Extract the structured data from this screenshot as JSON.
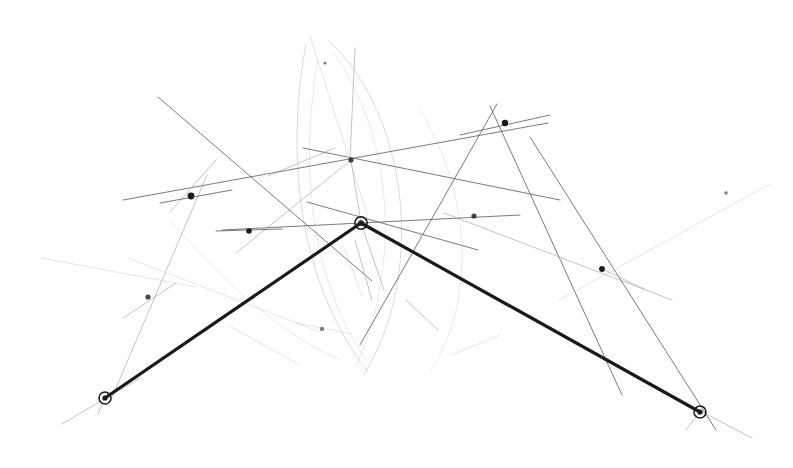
{
  "figure": {
    "medium": "pencil-on-paper scan",
    "canvas": {
      "width": 793,
      "height": 468,
      "background": "#ffffff"
    },
    "ink": {
      "primary_path": "#1a1a1a",
      "construction_line": "#5a5a62",
      "faint_line": "#9a9aa2",
      "very_faint_line": "#c2c2c8",
      "arc": "#b4b4bc",
      "node_fill": "#1a1a1a",
      "ring_stroke": "#1a1a1a"
    },
    "stroke_widths": {
      "primary_path": 3.2,
      "construction_line": 0.85,
      "faint_line": 0.7,
      "very_faint_line": 0.6,
      "arc": 0.7
    }
  },
  "chart_data": {
    "type": "scatter",
    "xlabel": "",
    "ylabel": "",
    "xlim": [
      0,
      793
    ],
    "ylim": [
      0,
      468
    ],
    "grid": false,
    "legend": null,
    "annotations": [],
    "ringed_vertices": [
      {
        "name": "left-vertex",
        "x": 105,
        "y": 398,
        "r_outer": 6.0,
        "r_inner": 2.6
      },
      {
        "name": "apex-vertex",
        "x": 361,
        "y": 223,
        "r_outer": 6.2,
        "r_inner": 2.8
      },
      {
        "name": "right-vertex",
        "x": 700,
        "y": 412,
        "r_outer": 6.0,
        "r_inner": 2.6
      }
    ],
    "primary_path": {
      "name": "bold-v-path",
      "points": [
        [
          105,
          398
        ],
        [
          361,
          223
        ],
        [
          700,
          412
        ]
      ]
    },
    "nodes": [
      {
        "name": "node-upper-left",
        "x": 191,
        "y": 196,
        "r": 3.4,
        "weight": "heavy"
      },
      {
        "name": "node-mid-left",
        "x": 249,
        "y": 231,
        "r": 2.8,
        "weight": "heavy"
      },
      {
        "name": "node-upper-center",
        "x": 351,
        "y": 160,
        "r": 2.6,
        "weight": "medium"
      },
      {
        "name": "node-upper-right",
        "x": 505,
        "y": 123,
        "r": 3.2,
        "weight": "heavy"
      },
      {
        "name": "node-mid-right",
        "x": 474,
        "y": 216,
        "r": 2.6,
        "weight": "medium"
      },
      {
        "name": "node-right",
        "x": 602,
        "y": 269,
        "r": 2.9,
        "weight": "heavy"
      },
      {
        "name": "node-lower-left",
        "x": 148,
        "y": 297,
        "r": 2.6,
        "weight": "medium"
      },
      {
        "name": "node-lower-center",
        "x": 322,
        "y": 329,
        "r": 2.2,
        "weight": "light"
      },
      {
        "name": "node-far-upper-right",
        "x": 726,
        "y": 193,
        "r": 1.8,
        "weight": "light"
      },
      {
        "name": "node-top-left-faint",
        "x": 325,
        "y": 63,
        "r": 1.6,
        "weight": "light"
      }
    ],
    "construction_lines": [
      {
        "name": "line-topleft-to-botright",
        "x1": 158,
        "y1": 97,
        "x2": 372,
        "y2": 281,
        "shade": "construction"
      },
      {
        "name": "line-ul-diag-down",
        "x1": 207,
        "y1": 175,
        "x2": 110,
        "y2": 402,
        "shade": "faint"
      },
      {
        "name": "line-long-left-sweep",
        "x1": 123,
        "y1": 200,
        "x2": 548,
        "y2": 123,
        "shade": "construction"
      },
      {
        "name": "line-apex-spoke-nw",
        "x1": 307,
        "y1": 202,
        "x2": 478,
        "y2": 250,
        "shade": "construction"
      },
      {
        "name": "line-apex-ray-left",
        "x1": 222,
        "y1": 230,
        "x2": 520,
        "y2": 215,
        "shade": "construction"
      },
      {
        "name": "line-node-upcenter-ray",
        "x1": 303,
        "y1": 148,
        "x2": 560,
        "y2": 200,
        "shade": "construction"
      },
      {
        "name": "line-upcenter-to-apex",
        "x1": 351,
        "y1": 160,
        "x2": 361,
        "y2": 223,
        "shade": "faint"
      },
      {
        "name": "line-upcenter-to-lowerleft",
        "x1": 351,
        "y1": 160,
        "x2": 236,
        "y2": 253,
        "shade": "faint"
      },
      {
        "name": "line-upright-down-left",
        "x1": 497,
        "y1": 104,
        "x2": 360,
        "y2": 345,
        "shade": "construction"
      },
      {
        "name": "line-upright-down-right",
        "x1": 490,
        "y1": 106,
        "x2": 622,
        "y2": 395,
        "shade": "construction"
      },
      {
        "name": "line-right-long-diag",
        "x1": 530,
        "y1": 137,
        "x2": 716,
        "y2": 430,
        "shade": "construction"
      },
      {
        "name": "line-node-right-sweep",
        "x1": 444,
        "y1": 213,
        "x2": 672,
        "y2": 300,
        "shade": "faint"
      },
      {
        "name": "line-far-right-diag",
        "x1": 559,
        "y1": 300,
        "x2": 770,
        "y2": 184,
        "shade": "very-faint"
      },
      {
        "name": "line-right-short-tick",
        "x1": 602,
        "y1": 269,
        "x2": 644,
        "y2": 289,
        "shade": "faint"
      },
      {
        "name": "line-lowerleft-tick",
        "x1": 123,
        "y1": 318,
        "x2": 176,
        "y2": 283,
        "shade": "faint"
      },
      {
        "name": "line-far-left-faint",
        "x1": 42,
        "y1": 258,
        "x2": 196,
        "y2": 287,
        "shade": "very-faint"
      },
      {
        "name": "line-lowerleft-to-apexarc",
        "x1": 128,
        "y1": 258,
        "x2": 320,
        "y2": 332,
        "shade": "very-faint"
      },
      {
        "name": "line-bottomleft-sweep",
        "x1": 228,
        "y1": 325,
        "x2": 300,
        "y2": 365,
        "shade": "very-faint"
      },
      {
        "name": "line-node-lowcenter-left",
        "x1": 296,
        "y1": 323,
        "x2": 352,
        "y2": 334,
        "shade": "very-faint"
      },
      {
        "name": "line-apex-down-spoke",
        "x1": 361,
        "y1": 223,
        "x2": 384,
        "y2": 290,
        "shade": "faint"
      },
      {
        "name": "line-apex-down-spoke-2",
        "x1": 355,
        "y1": 240,
        "x2": 372,
        "y2": 300,
        "shade": "faint"
      },
      {
        "name": "line-mid-down-short",
        "x1": 345,
        "y1": 250,
        "x2": 362,
        "y2": 296,
        "shade": "very-faint"
      },
      {
        "name": "line-lower-right-short",
        "x1": 406,
        "y1": 300,
        "x2": 438,
        "y2": 330,
        "shade": "faint"
      },
      {
        "name": "line-lower-right-short-2",
        "x1": 452,
        "y1": 355,
        "x2": 500,
        "y2": 335,
        "shade": "very-faint"
      },
      {
        "name": "line-left-vertex-thru",
        "x1": 62,
        "y1": 424,
        "x2": 140,
        "y2": 378,
        "shade": "faint"
      },
      {
        "name": "line-left-vertex-down",
        "x1": 105,
        "y1": 398,
        "x2": 98,
        "y2": 414,
        "shade": "faint"
      },
      {
        "name": "line-right-vertex-thru",
        "x1": 660,
        "y1": 390,
        "x2": 752,
        "y2": 438,
        "shade": "faint"
      },
      {
        "name": "line-right-vertex-tick",
        "x1": 700,
        "y1": 412,
        "x2": 686,
        "y2": 430,
        "shade": "faint"
      },
      {
        "name": "line-top-center-vert",
        "x1": 355,
        "y1": 48,
        "x2": 350,
        "y2": 160,
        "shade": "faint"
      },
      {
        "name": "line-top-left-long",
        "x1": 310,
        "y1": 36,
        "x2": 372,
        "y2": 230,
        "shade": "very-faint"
      },
      {
        "name": "line-upcenter-fan-a",
        "x1": 335,
        "y1": 148,
        "x2": 268,
        "y2": 176,
        "shade": "faint"
      },
      {
        "name": "line-ul-node-fan",
        "x1": 216,
        "y1": 160,
        "x2": 170,
        "y2": 212,
        "shade": "faint"
      },
      {
        "name": "line-midleft-node-tick",
        "x1": 216,
        "y1": 231,
        "x2": 282,
        "y2": 229,
        "shade": "construction"
      },
      {
        "name": "line-ul-node-tick",
        "x1": 160,
        "y1": 203,
        "x2": 232,
        "y2": 190,
        "shade": "construction"
      },
      {
        "name": "line-upright-node-tick",
        "x1": 460,
        "y1": 135,
        "x2": 550,
        "y2": 115,
        "shade": "construction"
      }
    ],
    "arcs": [
      {
        "name": "arc-left-vesica",
        "d": "M 306 44 C 286 150, 296 280, 368 372",
        "shade": "arc"
      },
      {
        "name": "arc-right-vesica",
        "d": "M 330 42 C 412 120, 424 280, 364 374",
        "shade": "arc"
      },
      {
        "name": "arc-inner-left",
        "d": "M 318 60 C 300 160, 308 275, 366 360",
        "shade": "arc-faint"
      },
      {
        "name": "arc-through-apex",
        "d": "M 333 52 C 396 140, 400 270, 356 366",
        "shade": "arc-faint"
      },
      {
        "name": "arc-lower-left",
        "d": "M 170 220 C 230 290, 290 340, 342 360",
        "shade": "arc-faint"
      },
      {
        "name": "arc-wide-right",
        "d": "M 420 110 C 470 190, 478 300, 430 372",
        "shade": "arc-faint"
      }
    ]
  }
}
